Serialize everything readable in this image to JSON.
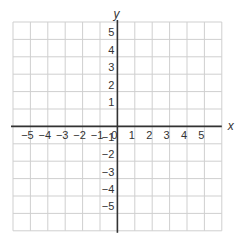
{
  "chart_data": {
    "type": "scatter",
    "title": "",
    "xlabel": "x",
    "ylabel": "y",
    "xlim": [
      -6,
      6
    ],
    "ylim": [
      -6,
      6
    ],
    "grid": true,
    "x_ticks": [
      -5,
      -4,
      -3,
      -2,
      -1,
      0,
      1,
      2,
      3,
      4,
      5
    ],
    "y_ticks": [
      5,
      4,
      3,
      2,
      1,
      -1,
      -2,
      -3,
      -4,
      -5
    ],
    "x_tick_labels": [
      "−5",
      "−4",
      "−3",
      "−2",
      "−1",
      "0",
      "1",
      "2",
      "3",
      "4",
      "5"
    ],
    "y_tick_labels": [
      "5",
      "4",
      "3",
      "2",
      "1",
      "−1",
      "−2",
      "−3",
      "−4",
      "−5"
    ],
    "series": [],
    "legend": null
  },
  "colors": {
    "grid": "#cfcfcf",
    "axis": "#333333",
    "text": "#333333",
    "background": "#ffffff"
  },
  "layout": {
    "grid_left": 13,
    "grid_top": 22,
    "cell": 17.4,
    "cells": 12
  }
}
